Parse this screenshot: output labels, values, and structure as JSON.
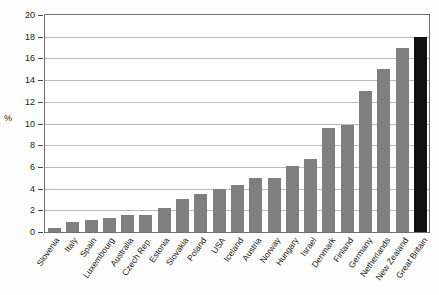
{
  "axis": {
    "y_title": "%",
    "y_ticks": [
      0,
      2,
      4,
      6,
      8,
      10,
      12,
      14,
      16,
      18,
      20
    ]
  },
  "colors": {
    "bar": "#7f7f7f",
    "highlight_bar": "#111111",
    "gridline": "#b9b9b9",
    "frame": "#6f6f6f"
  },
  "chart_data": {
    "type": "bar",
    "title": "",
    "xlabel": "",
    "ylabel": "%",
    "ylim": [
      0,
      20
    ],
    "ytick_step": 2,
    "grid": true,
    "legend": "none",
    "highlight_category": "Great Britain",
    "categories": [
      "Slovenia",
      "Italy",
      "Spain",
      "Luxembourg",
      "Australia",
      "Czech Rep.",
      "Estonia",
      "Slovakia",
      "Poland",
      "USA",
      "Iceland",
      "Austria",
      "Norway",
      "Hungary",
      "Israel",
      "Denmark",
      "Finland",
      "Germany",
      "Netherlands",
      "New Zealand",
      "Great Britain"
    ],
    "values": [
      0.35,
      0.95,
      1.1,
      1.25,
      1.6,
      1.55,
      2.2,
      3.05,
      3.5,
      3.95,
      4.3,
      5.0,
      5.0,
      6.1,
      6.7,
      9.6,
      9.9,
      13.0,
      15.0,
      17.0,
      18.0
    ]
  }
}
